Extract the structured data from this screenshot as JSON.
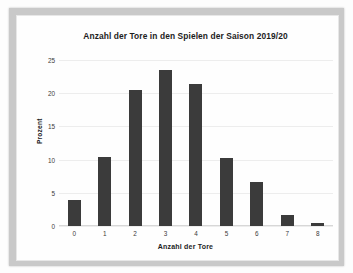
{
  "chart_data": {
    "type": "bar",
    "title": "Anzahl der Tore in den Spielen der Saison 2019/20",
    "xlabel": "Anzahl der Tore",
    "ylabel": "Prozent",
    "categories": [
      "0",
      "1",
      "2",
      "3",
      "4",
      "5",
      "6",
      "7",
      "8"
    ],
    "values": [
      3.9,
      10.4,
      20.5,
      23.5,
      21.4,
      10.3,
      6.6,
      1.7,
      0.4
    ],
    "series": [
      {
        "name": "Prozent",
        "values": [
          3.9,
          10.4,
          20.5,
          23.5,
          21.4,
          10.3,
          6.6,
          1.7,
          0.4
        ]
      }
    ],
    "ylim": [
      0,
      25
    ],
    "yticks": [
      "0",
      "5",
      "10",
      "15",
      "20",
      "25"
    ],
    "ytick_values": [
      0,
      5,
      10,
      15,
      20,
      25
    ],
    "grid": true,
    "legend": false,
    "bar_color": "#3b3b3b",
    "plot_background": "#ffffff",
    "grid_color": "#ededed"
  }
}
